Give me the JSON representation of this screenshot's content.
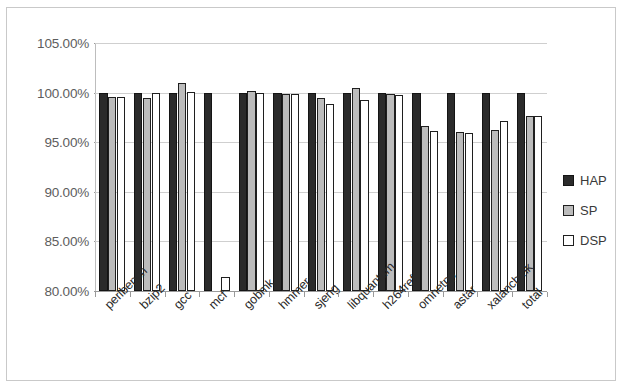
{
  "chart_data": {
    "type": "bar",
    "title": "",
    "subtitle": "",
    "xlabel": "",
    "ylabel": "",
    "ylim": [
      80,
      105
    ],
    "ytick_labels": [
      "105.00%",
      "100.00%",
      "95.00%",
      "90.00%",
      "85.00%",
      "80.00%"
    ],
    "ytick_values": [
      105,
      100,
      95,
      90,
      85,
      80
    ],
    "grid": true,
    "legend_position": "right",
    "categories": [
      "perlbench",
      "bzip2",
      "gcc",
      "mcf",
      "gobmk",
      "hmmer",
      "sjeng",
      "libquantum",
      "h264ref",
      "omnetpp",
      "astar",
      "xalancbmk",
      "total"
    ],
    "series": [
      {
        "name": "HAP",
        "color": "#2b2b2b",
        "values": [
          100.0,
          100.0,
          100.0,
          100.0,
          100.0,
          100.0,
          100.0,
          100.0,
          100.0,
          100.0,
          100.0,
          100.0,
          100.0
        ]
      },
      {
        "name": "SP",
        "color": "#bcbcbc",
        "values": [
          99.6,
          99.5,
          101.0,
          80.0,
          100.2,
          99.9,
          99.5,
          100.5,
          99.9,
          96.6,
          96.0,
          96.2,
          97.6
        ]
      },
      {
        "name": "DSP",
        "color": "#ffffff",
        "values": [
          99.6,
          100.0,
          100.1,
          81.4,
          100.0,
          99.9,
          98.9,
          99.3,
          99.8,
          96.1,
          95.9,
          97.1,
          97.6
        ]
      }
    ]
  },
  "legend": {
    "entries": [
      {
        "label": "HAP",
        "swatch": "hap"
      },
      {
        "label": "SP",
        "swatch": "sp"
      },
      {
        "label": "DSP",
        "swatch": "dsp"
      }
    ]
  }
}
